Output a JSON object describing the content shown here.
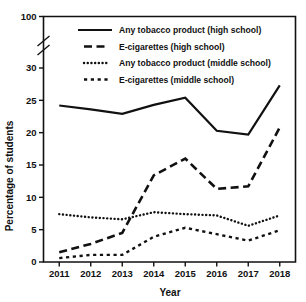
{
  "chart_data": {
    "type": "line",
    "title": "",
    "xlabel": "Year",
    "ylabel": "Percentage of students",
    "categories": [
      2011,
      2012,
      2013,
      2014,
      2015,
      2016,
      2017,
      2018
    ],
    "xtick_labels": [
      "2011",
      "2012",
      "2013",
      "2014",
      "2015",
      "2016",
      "2017",
      "2018"
    ],
    "ytick_labels": [
      "0",
      "5",
      "10",
      "15",
      "20",
      "25",
      "30",
      "100"
    ],
    "ytick_values": [
      0,
      5,
      10,
      15,
      20,
      25,
      30,
      100
    ],
    "ylim": [
      0,
      30
    ],
    "ylim_top_label": "100",
    "axis_break": true,
    "axis_break_note": "y-axis broken between 30 and 100",
    "grid": false,
    "legend_position": "top-center",
    "series": [
      {
        "name": "Any tobacco product (high school)",
        "style": "solid",
        "color": "#111111",
        "values": [
          24.2,
          23.6,
          22.9,
          24.3,
          25.4,
          20.3,
          19.7,
          27.3
        ]
      },
      {
        "name": "E-cigarettes (high school)",
        "style": "dashed",
        "color": "#111111",
        "values": [
          1.5,
          2.8,
          4.5,
          13.4,
          16.0,
          11.3,
          11.7,
          20.8
        ]
      },
      {
        "name": "Any tobacco product (middle school)",
        "style": "dotted",
        "color": "#111111",
        "values": [
          7.4,
          6.9,
          6.6,
          7.7,
          7.4,
          7.2,
          5.6,
          7.2
        ]
      },
      {
        "name": "E-cigarettes (middle school)",
        "style": "dash-dot",
        "color": "#111111",
        "values": [
          0.6,
          1.1,
          1.1,
          3.9,
          5.3,
          4.3,
          3.3,
          4.9
        ]
      }
    ]
  },
  "legend": {
    "items": [
      {
        "label": "Any tobacco product (high school)",
        "style": "solid"
      },
      {
        "label": "E-cigarettes (high school)",
        "style": "dashed"
      },
      {
        "label": "Any tobacco product (middle school)",
        "style": "dotted"
      },
      {
        "label": "E-cigarettes (middle school)",
        "style": "dash-dot"
      }
    ]
  },
  "axes": {
    "y_title": "Percentage of students",
    "x_title": "Year"
  }
}
